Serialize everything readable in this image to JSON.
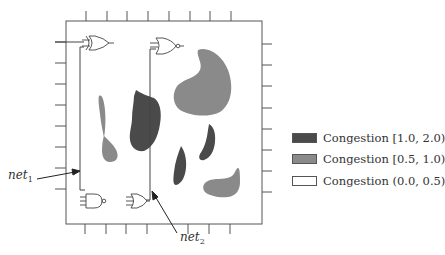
{
  "figure": {
    "type": "congestion-map-diagram",
    "chip_box": {
      "x": 66,
      "y": 21,
      "width": 196,
      "height": 203
    },
    "ticks": {
      "top_x": [
        86,
        107,
        127,
        148,
        169,
        190,
        210,
        231
      ],
      "bottom_x": [
        85,
        106,
        126,
        147,
        188,
        209,
        230
      ],
      "left_y": [
        42,
        63,
        84,
        105,
        126,
        147,
        168,
        189
      ],
      "right_y": [
        44,
        65,
        86,
        108,
        129,
        150,
        171,
        192
      ]
    },
    "gates": [
      {
        "id": "gate-xor-top-left",
        "kind": "XOR",
        "x": 84,
        "y": 40
      },
      {
        "id": "gate-nor-top-middle",
        "kind": "NOR",
        "x": 156,
        "y": 42
      },
      {
        "id": "gate-nand-bottom-left",
        "kind": "NAND",
        "x": 86,
        "y": 201
      },
      {
        "id": "gate-or-bottom-middle",
        "kind": "OR",
        "x": 131,
        "y": 201
      }
    ],
    "nets": [
      {
        "id": "net1",
        "label": "net",
        "subscript": "1"
      },
      {
        "id": "net2",
        "label": "net",
        "subscript": "2"
      }
    ],
    "colors": {
      "high": "#4a4a4a",
      "medium": "#8a8a8a",
      "low": "#ffffff",
      "stroke": "#444444"
    }
  },
  "labels": {
    "net1": {
      "text": "net",
      "sub": "1"
    },
    "net2": {
      "text": "net",
      "sub": "2"
    }
  },
  "legend": {
    "items": [
      {
        "label": "Congestion [1.0, 2.0)",
        "color": "#4a4a4a"
      },
      {
        "label": "Congestion [0.5, 1.0)",
        "color": "#8a8a8a"
      },
      {
        "label": "Congestion (0.0, 0.5)",
        "color": "#ffffff"
      }
    ]
  }
}
